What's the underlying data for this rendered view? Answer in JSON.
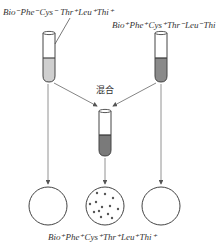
{
  "diagram": {
    "labels": {
      "left_strain": [
        {
          "gene": "Bio",
          "sign": "-"
        },
        {
          "gene": "Phe",
          "sign": "-"
        },
        {
          "gene": "Cys",
          "sign": "-"
        },
        {
          "gene": "Thr",
          "sign": "+"
        },
        {
          "gene": "Leu",
          "sign": "+"
        },
        {
          "gene": "Thi",
          "sign": "+"
        }
      ],
      "right_strain": [
        {
          "gene": "Bio",
          "sign": "+"
        },
        {
          "gene": "Phe",
          "sign": "+"
        },
        {
          "gene": "Cys",
          "sign": "+"
        },
        {
          "gene": "Thr",
          "sign": "-"
        },
        {
          "gene": "Leu",
          "sign": "-"
        },
        {
          "gene": "Thi",
          "sign": "-"
        }
      ],
      "result_strain": [
        {
          "gene": "Bio",
          "sign": "+"
        },
        {
          "gene": "Phe",
          "sign": "+"
        },
        {
          "gene": "Cys",
          "sign": "+"
        },
        {
          "gene": "Thr",
          "sign": "+"
        },
        {
          "gene": "Leu",
          "sign": "+"
        },
        {
          "gene": "Thi",
          "sign": "+"
        }
      ],
      "mix": "混合"
    },
    "text": {
      "left_strain": "Bio⁻Phe⁻Cys⁻ Thr⁺Leu⁺Thi⁺",
      "right_strain": "Bio⁺Phe⁺Cys⁺Thr⁻Leu⁻Thi⁻",
      "result_strain": "Bio⁺Phe⁺Cys⁺Thr⁺Leu⁺Thi⁺",
      "mix": "混合"
    },
    "tubes": [
      {
        "name": "left",
        "liquid_color": "#cfcfcf"
      },
      {
        "name": "right",
        "liquid_color": "#8a8a8a"
      },
      {
        "name": "mixed",
        "liquid_color": "#7a7a7a"
      }
    ],
    "plates": [
      {
        "name": "left",
        "colonies": 0
      },
      {
        "name": "middle",
        "colonies": 13
      },
      {
        "name": "right",
        "colonies": 0
      }
    ]
  }
}
